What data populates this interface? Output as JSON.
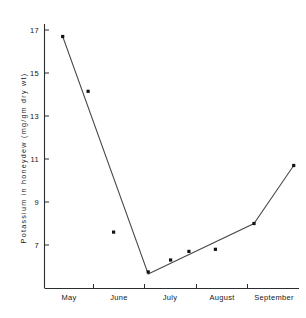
{
  "chart_data": {
    "type": "line",
    "title": "",
    "xlabel": "",
    "ylabel": "Potassium in honeydew  (mg/gm dry wt)",
    "ylim": [
      5.2,
      17.6
    ],
    "yticks": [
      7,
      9,
      11,
      13,
      15,
      17
    ],
    "ytick_labels": [
      "7",
      "9",
      "11",
      "13",
      "15",
      "17"
    ],
    "xtick_labels": [
      "May",
      "June",
      "July",
      "August",
      "September"
    ],
    "grid": false,
    "legend": null,
    "series": [
      {
        "name": "Potassium in honeydew",
        "marker": "filled-square",
        "line": true,
        "points": [
          {
            "x": 0.18,
            "label": "May",
            "y": 16.7
          },
          {
            "x": 0.68,
            "label": "May",
            "y": 14.15
          },
          {
            "x": 1.18,
            "label": "June",
            "y": 7.6
          },
          {
            "x": 1.86,
            "label": "June",
            "y": 5.75
          },
          {
            "x": 2.3,
            "label": "July",
            "y": 6.3
          },
          {
            "x": 2.66,
            "label": "July",
            "y": 6.7
          },
          {
            "x": 3.18,
            "label": "August",
            "y": 6.8
          },
          {
            "x": 3.94,
            "label": "August",
            "y": 8.0
          },
          {
            "x": 4.72,
            "label": "September",
            "y": 10.7
          }
        ],
        "line_vertices": [
          {
            "x": 0.18,
            "y": 16.7
          },
          {
            "x": 1.86,
            "y": 5.65
          },
          {
            "x": 3.94,
            "y": 8.0
          },
          {
            "x": 4.72,
            "y": 10.7
          }
        ]
      }
    ],
    "colors": {
      "axis": "#2b2d2f",
      "line": "#46484a",
      "marker": "#101213",
      "background": "#ffffff"
    }
  }
}
